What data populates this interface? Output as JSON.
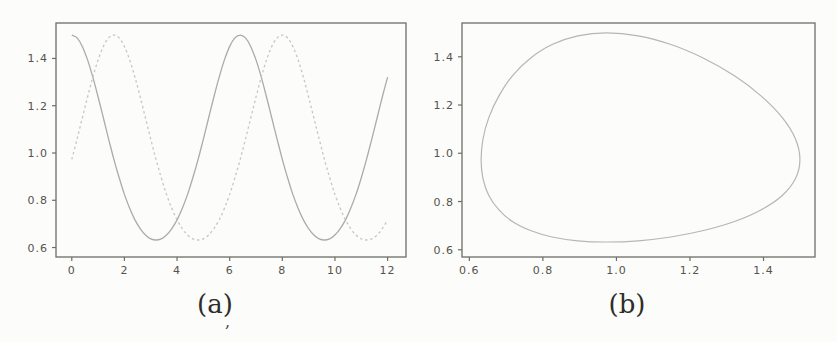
{
  "page": {
    "background": "#fcfcfa",
    "artifact_mark": ","
  },
  "chart_data": [
    {
      "id": "a",
      "type": "line",
      "caption": "(a)",
      "title": "",
      "xlabel": "",
      "ylabel": "",
      "grid": false,
      "legend": null,
      "xlim": [
        -0.6,
        12.7
      ],
      "ylim": [
        0.56,
        1.55
      ],
      "frame_color": "#6e6d66",
      "tick_color": "#55534b",
      "xticks": {
        "values": [
          0,
          2,
          4,
          6,
          8,
          10,
          12
        ],
        "labels": [
          "0",
          "2",
          "4",
          "6",
          "8",
          "10",
          "12"
        ]
      },
      "yticks": {
        "values": [
          0.6,
          0.8,
          1.0,
          1.2,
          1.4
        ],
        "labels": [
          "0.6",
          "0.8",
          "1.0",
          "1.2",
          "1.4"
        ]
      },
      "x": [
        0,
        0.2,
        0.4,
        0.6,
        0.8,
        1.0,
        1.2,
        1.4,
        1.6,
        1.8,
        2.0,
        2.2,
        2.4,
        2.6,
        2.8,
        3.0,
        3.2,
        3.4,
        3.6,
        3.8,
        4.0,
        4.2,
        4.4,
        4.6,
        4.8,
        5.0,
        5.2,
        5.4,
        5.6,
        5.8,
        6.0,
        6.2,
        6.4,
        6.6,
        6.8,
        7.0,
        7.2,
        7.4,
        7.6,
        7.8,
        8.0,
        8.2,
        8.4,
        8.6,
        8.8,
        9.0,
        9.2,
        9.4,
        9.6,
        9.8,
        10.0,
        10.2,
        10.4,
        10.6,
        10.8,
        11.0,
        11.2,
        11.4,
        11.6,
        11.8,
        12.0
      ],
      "series": [
        {
          "name": "solid-curve",
          "style": "solid",
          "color": "#a9ada4",
          "values": [
            1.499,
            1.487,
            1.451,
            1.394,
            1.321,
            1.237,
            1.148,
            1.059,
            0.973,
            0.895,
            0.825,
            0.766,
            0.717,
            0.68,
            0.653,
            0.637,
            0.632,
            0.637,
            0.653,
            0.68,
            0.717,
            0.766,
            0.825,
            0.895,
            0.973,
            1.059,
            1.148,
            1.237,
            1.321,
            1.394,
            1.451,
            1.487,
            1.499,
            1.487,
            1.451,
            1.394,
            1.321,
            1.237,
            1.148,
            1.059,
            0.973,
            0.895,
            0.825,
            0.766,
            0.717,
            0.68,
            0.653,
            0.637,
            0.632,
            0.637,
            0.653,
            0.68,
            0.717,
            0.766,
            0.825,
            0.895,
            0.973,
            1.059,
            1.148,
            1.237,
            1.321
          ]
        },
        {
          "name": "dashed-curve",
          "style": "dashed",
          "color": "#c3c9bc",
          "values": [
            0.973,
            1.059,
            1.148,
            1.237,
            1.321,
            1.394,
            1.451,
            1.487,
            1.499,
            1.487,
            1.451,
            1.394,
            1.321,
            1.237,
            1.148,
            1.059,
            0.973,
            0.895,
            0.825,
            0.766,
            0.717,
            0.68,
            0.653,
            0.637,
            0.632,
            0.637,
            0.653,
            0.68,
            0.717,
            0.766,
            0.825,
            0.895,
            0.973,
            1.059,
            1.148,
            1.237,
            1.321,
            1.394,
            1.451,
            1.487,
            1.499,
            1.487,
            1.451,
            1.394,
            1.321,
            1.237,
            1.148,
            1.059,
            0.973,
            0.895,
            0.825,
            0.766,
            0.717,
            0.68,
            0.653,
            0.637,
            0.632,
            0.637,
            0.653,
            0.68,
            0.717
          ]
        }
      ]
    },
    {
      "id": "b",
      "type": "line",
      "caption": "(b)",
      "title": "",
      "xlabel": "",
      "ylabel": "",
      "grid": false,
      "legend": null,
      "xlim": [
        0.58,
        1.54
      ],
      "ylim": [
        0.57,
        1.54
      ],
      "frame_color": "#6e6d66",
      "tick_color": "#55534b",
      "xticks": {
        "values": [
          0.6,
          0.8,
          1.0,
          1.2,
          1.4
        ],
        "labels": [
          "0.6",
          "0.8",
          "1.0",
          "1.2",
          "1.4"
        ]
      },
      "yticks": {
        "values": [
          0.6,
          0.8,
          1.0,
          1.2,
          1.4
        ],
        "labels": [
          "0.6",
          "0.8",
          "1.0",
          "1.2",
          "1.4"
        ]
      },
      "orbit": {
        "name": "closed-orbit",
        "style": "solid",
        "color": "#b3b9ae",
        "closed": true,
        "x": [
          1.499,
          1.487,
          1.451,
          1.394,
          1.321,
          1.237,
          1.148,
          1.059,
          0.973,
          0.895,
          0.825,
          0.766,
          0.717,
          0.68,
          0.653,
          0.637,
          0.632,
          0.637,
          0.653,
          0.68,
          0.717,
          0.766,
          0.825,
          0.895,
          0.973,
          1.059,
          1.148,
          1.237,
          1.321,
          1.394,
          1.451,
          1.487,
          1.499
        ],
        "y": [
          0.973,
          1.059,
          1.148,
          1.237,
          1.321,
          1.394,
          1.451,
          1.487,
          1.499,
          1.487,
          1.451,
          1.394,
          1.321,
          1.237,
          1.148,
          1.059,
          0.973,
          0.895,
          0.825,
          0.766,
          0.717,
          0.68,
          0.653,
          0.637,
          0.632,
          0.637,
          0.653,
          0.68,
          0.717,
          0.766,
          0.825,
          0.895,
          0.973
        ]
      }
    }
  ]
}
